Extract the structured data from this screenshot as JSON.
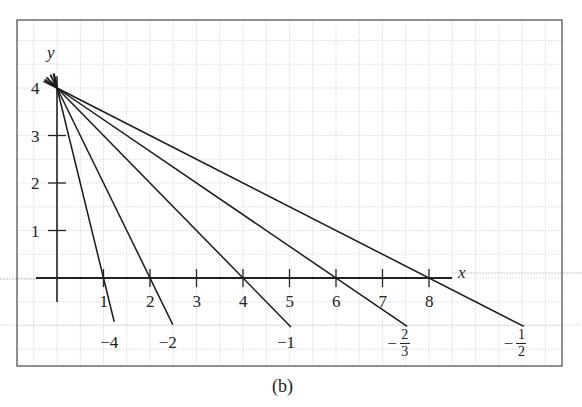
{
  "chart_data": {
    "type": "line",
    "title": "",
    "caption": "(b)",
    "xlabel": "x",
    "ylabel": "y",
    "xlim": [
      -0.4,
      8.5
    ],
    "ylim": [
      -1.1,
      4.3
    ],
    "x_ticks": [
      1,
      2,
      3,
      4,
      5,
      6,
      7,
      8
    ],
    "x_tick_labels": [
      "1",
      "2",
      "3",
      "4",
      "5",
      "6",
      "7",
      "8"
    ],
    "y_ticks": [
      1,
      2,
      3,
      4
    ],
    "y_tick_labels": [
      "1",
      "2",
      "3",
      "4"
    ],
    "grid": true,
    "common_point": [
      0,
      4
    ],
    "series": [
      {
        "name": "slope -4",
        "label": "−4",
        "slope": -4,
        "x_intercept": 1,
        "x": [
          0,
          1.23
        ],
        "y": [
          4,
          -0.92
        ]
      },
      {
        "name": "slope -2",
        "label": "−2",
        "slope": -2,
        "x_intercept": 2,
        "x": [
          0,
          2.49
        ],
        "y": [
          4,
          -0.98
        ]
      },
      {
        "name": "slope -1",
        "label": "−1",
        "slope": -1,
        "x_intercept": 4,
        "x": [
          0,
          5.03
        ],
        "y": [
          4,
          -1.03
        ]
      },
      {
        "name": "slope -2/3",
        "label": "−2/3",
        "label_num": "2",
        "label_den": "3",
        "slope": -0.6667,
        "x_intercept": 6,
        "x": [
          0,
          7.53
        ],
        "y": [
          4,
          -1.02
        ]
      },
      {
        "name": "slope -1/2",
        "label": "−1/2",
        "label_num": "1",
        "label_den": "2",
        "slope": -0.5,
        "x_intercept": 8,
        "x": [
          0,
          10.04
        ],
        "y": [
          4,
          -1.02
        ]
      }
    ]
  },
  "labels": {
    "x_axis": "x",
    "y_axis": "y",
    "minus": "−",
    "caption": "(b)"
  }
}
